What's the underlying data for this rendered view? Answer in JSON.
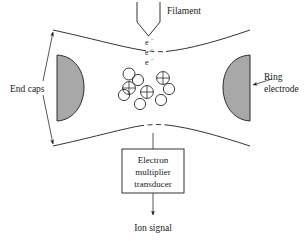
{
  "figure": {
    "background_color": "#ffffff",
    "line_color": "#1d1d1d",
    "electrode_fill_color": "#a8a8a8",
    "width": 307,
    "height": 241
  },
  "labels": {
    "filament": "Filament",
    "end_caps": "End caps",
    "ring_electrode_line1": "Ring",
    "ring_electrode_line2": "electrode",
    "transducer_line1": "Electron",
    "transducer_line2": "multiplier",
    "transducer_line3": "transducer",
    "ion_signal": "Ion signal"
  },
  "electrons": {
    "symbol": "e",
    "superscript": "−",
    "count": 3,
    "positions": [
      {
        "x": 152,
        "y": 42
      },
      {
        "x": 152,
        "y": 51
      },
      {
        "x": 152,
        "y": 60
      }
    ]
  },
  "particles": {
    "neutral_label": "neutral molecule",
    "ion_label": "positive ion",
    "neutrals": [
      {
        "cx": 129,
        "cy": 74,
        "r": 6.0
      },
      {
        "cx": 138,
        "cy": 80,
        "r": 5.6
      },
      {
        "cx": 169,
        "cy": 89,
        "r": 5.6
      },
      {
        "cx": 124,
        "cy": 95,
        "r": 5.6
      },
      {
        "cx": 140,
        "cy": 104,
        "r": 5.6
      },
      {
        "cx": 161,
        "cy": 100,
        "r": 5.6
      }
    ],
    "ions": [
      {
        "cx": 163,
        "cy": 78,
        "r": 6.4
      },
      {
        "cx": 129,
        "cy": 88,
        "r": 6.4
      },
      {
        "cx": 147,
        "cy": 92,
        "r": 6.4
      }
    ]
  },
  "electrodes": {
    "left_end_cap": {
      "x": 57,
      "y": 55,
      "width": 28,
      "height": 66
    },
    "right_end_cap": {
      "x": 222,
      "y": 55,
      "width": 28,
      "height": 66
    }
  },
  "transducer_box": {
    "x": 122,
    "y": 149,
    "width": 62,
    "height": 44
  },
  "colors": {
    "gray_electrode": "#a8a8a8",
    "ink": "#1d1d1d",
    "paper": "#ffffff"
  }
}
